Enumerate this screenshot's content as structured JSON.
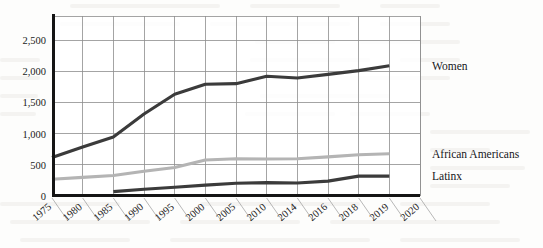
{
  "chart_data": {
    "type": "line",
    "title": "",
    "subtitle": "",
    "xlabel": "",
    "ylabel": "",
    "categories": [
      "1975",
      "1980",
      "1985",
      "1990",
      "1995",
      "2000",
      "2005",
      "2010",
      "2014",
      "2016",
      "2018",
      "2019",
      "2020"
    ],
    "ytick_labels": [
      "0",
      "500",
      "1,000",
      "1,500",
      "2,000",
      "2,500"
    ],
    "ytick_values": [
      0,
      500,
      1000,
      1500,
      2000,
      2500
    ],
    "ylim": [
      0,
      2900
    ],
    "grid": "both",
    "legend_position": "right-inline",
    "series": [
      {
        "name": "Women",
        "color": "#3b3b3b",
        "values": [
          620,
          790,
          950,
          1320,
          1640,
          1800,
          1810,
          1930,
          1900,
          1960,
          2020,
          2100,
          null
        ]
      },
      {
        "name": "African Americans",
        "color": "#b4b4b4",
        "values": [
          270,
          300,
          330,
          400,
          460,
          580,
          600,
          595,
          600,
          630,
          665,
          680,
          null
        ]
      },
      {
        "name": "Latinx",
        "color": "#3b3b3b",
        "values": [
          null,
          null,
          70,
          110,
          140,
          175,
          205,
          215,
          210,
          240,
          320,
          320,
          null
        ]
      }
    ]
  },
  "legend": {
    "items": [
      {
        "label": "Women"
      },
      {
        "label": "African Americans"
      },
      {
        "label": "Latinx"
      }
    ]
  },
  "axis": {
    "y_axis_color": "#141414",
    "x_axis_color": "#141414",
    "grid_color": "#8d8d8d"
  }
}
